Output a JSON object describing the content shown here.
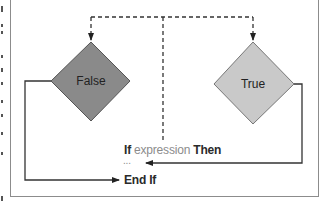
{
  "diagram": {
    "type": "flowchart",
    "nodes": {
      "false_node": {
        "label": "False",
        "fill": "#8a8a8a"
      },
      "true_node": {
        "label": "True",
        "fill": "#c9c9c9"
      }
    },
    "code": {
      "if_keyword": "If",
      "expression": "expression",
      "then_keyword": "Then",
      "ellipsis": "...",
      "end_if": "End If"
    },
    "colors": {
      "frame_border": "#8c8c8c",
      "line": "#333333",
      "keyword_text": "#2a2a2a",
      "expression_text": "#8c8c8c"
    }
  }
}
